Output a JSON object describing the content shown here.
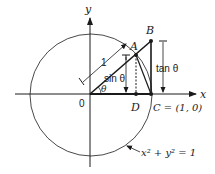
{
  "diagram": {
    "type": "unit-circle-trig",
    "labels": {
      "y_axis": "y",
      "x_axis": "x",
      "origin": "0",
      "point_A": "A",
      "point_B": "B",
      "point_D": "D",
      "point_C": "C = (1, 0)",
      "radius": "1",
      "angle": "θ",
      "sin": "sin θ",
      "tan": "tan θ",
      "circle_equation": "x² + y² = 1"
    },
    "colors": {
      "stroke": "#1a1a1a",
      "background": "#ffffff"
    }
  }
}
